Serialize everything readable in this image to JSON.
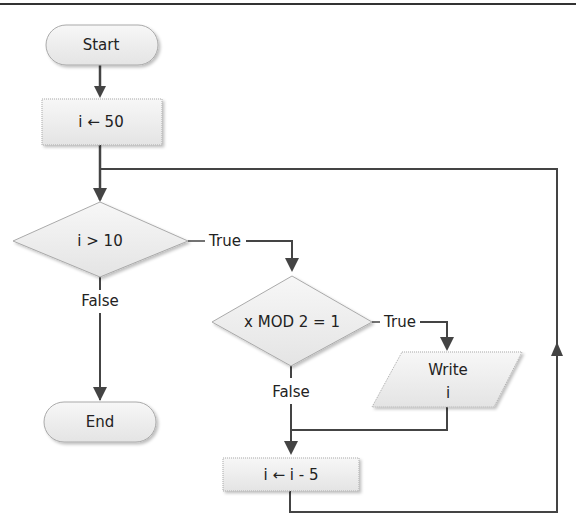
{
  "diagram": {
    "type": "flowchart",
    "colors": {
      "line": "#444444",
      "shape_fill": "#f0f0f0",
      "shape_stroke": "#999999",
      "text": "#222222"
    },
    "nodes": {
      "start": {
        "label": "Start",
        "shape": "terminator"
      },
      "init": {
        "label": "i ← 50",
        "shape": "process"
      },
      "cond1": {
        "label": "i > 10",
        "shape": "decision"
      },
      "cond2": {
        "label": "x MOD 2 = 1",
        "shape": "decision"
      },
      "write": {
        "label_line1": "Write",
        "label_line2": "i",
        "shape": "io"
      },
      "decrement": {
        "label": "i ← i - 5",
        "shape": "process"
      },
      "end": {
        "label": "End",
        "shape": "terminator"
      }
    },
    "edges": {
      "cond1_true": "True",
      "cond1_false": "False",
      "cond2_true": "True",
      "cond2_false": "False"
    }
  }
}
